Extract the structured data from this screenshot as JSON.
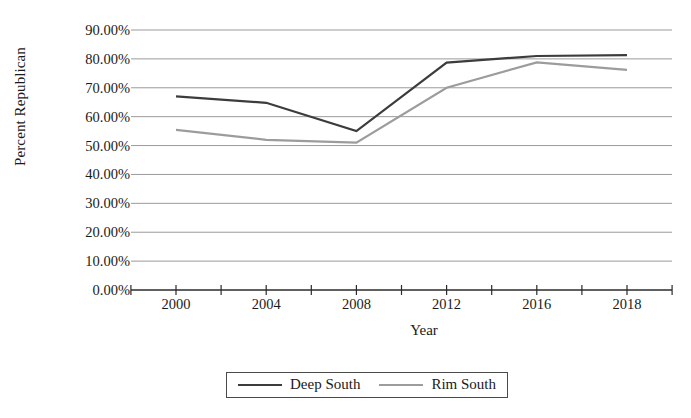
{
  "chart_data": {
    "type": "line",
    "title": "",
    "xlabel": "Year",
    "ylabel": "Percent Republican",
    "categories": [
      "2000",
      "2004",
      "2008",
      "2012",
      "2016",
      "2018"
    ],
    "ylim": [
      0,
      90
    ],
    "ytick_labels": [
      "0.00%",
      "10.00%",
      "20.00%",
      "30.00%",
      "40.00%",
      "50.00%",
      "60.00%",
      "70.00%",
      "80.00%",
      "90.00%"
    ],
    "ytick_values": [
      0,
      10,
      20,
      30,
      40,
      50,
      60,
      70,
      80,
      90
    ],
    "grid": "horizontal",
    "legend_position": "bottom",
    "series": [
      {
        "name": "Deep South",
        "color": "#3c3c3c",
        "values": [
          67.0,
          64.8,
          55.0,
          78.7,
          81.0,
          81.3
        ]
      },
      {
        "name": "Rim South",
        "color": "#9c9c9c",
        "values": [
          55.4,
          52.0,
          51.0,
          70.0,
          78.8,
          76.2
        ]
      }
    ]
  },
  "legend": {
    "entries": [
      {
        "label": "Deep South"
      },
      {
        "label": "Rim South"
      }
    ]
  }
}
